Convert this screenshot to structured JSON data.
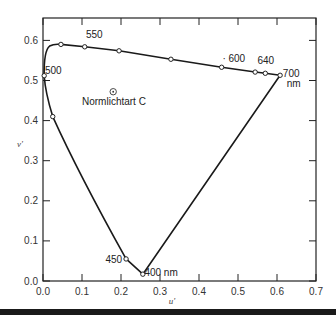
{
  "chart_data": {
    "type": "line",
    "title": "",
    "xlabel": "u'",
    "ylabel": "v'",
    "xlim": [
      0.0,
      0.7
    ],
    "ylim": [
      0.0,
      0.6
    ],
    "x_ticks": [
      "0.0",
      "0.1",
      "0.2",
      "0.3",
      "0.4",
      "0.5",
      "0.6",
      "0.7"
    ],
    "y_ticks": [
      "0.0",
      "0.1",
      "0.2",
      "0.3",
      "0.4",
      "0.5",
      "0.6"
    ],
    "grid": false,
    "series": [
      {
        "name": "spectral locus (CIE 1976 UCS)",
        "closed": true,
        "points": [
          {
            "u": 0.256,
            "v": 0.017,
            "label": "400 nm"
          },
          {
            "u": 0.213,
            "v": 0.055,
            "label": "450"
          },
          {
            "u": 0.025,
            "v": 0.41,
            "label": ""
          },
          {
            "u": 0.003,
            "v": 0.512,
            "label": "500"
          },
          {
            "u": 0.017,
            "v": 0.586,
            "label": ""
          },
          {
            "u": 0.046,
            "v": 0.59,
            "label": ""
          },
          {
            "u": 0.107,
            "v": 0.584,
            "label": "550"
          },
          {
            "u": 0.195,
            "v": 0.574,
            "label": ""
          },
          {
            "u": 0.328,
            "v": 0.553,
            "label": ""
          },
          {
            "u": 0.458,
            "v": 0.533,
            "label": "600"
          },
          {
            "u": 0.544,
            "v": 0.521,
            "label": ""
          },
          {
            "u": 0.57,
            "v": 0.518,
            "label": "640"
          },
          {
            "u": 0.608,
            "v": 0.513,
            "label": "700 nm"
          }
        ]
      }
    ],
    "markers": [
      {
        "name": "Normlichtart C",
        "u": 0.18,
        "v": 0.472,
        "symbol": "circle-dot"
      }
    ],
    "annotations": [
      {
        "text": "500",
        "u": 0.005,
        "v": 0.515
      },
      {
        "text": "550",
        "u": 0.11,
        "v": 0.605
      },
      {
        "text": "· 600",
        "u": 0.46,
        "v": 0.545
      },
      {
        "text": "640",
        "u": 0.55,
        "v": 0.54
      },
      {
        "text": "700",
        "u": 0.615,
        "v": 0.508
      },
      {
        "text": "nm",
        "u": 0.625,
        "v": 0.485
      },
      {
        "text": "450",
        "u": 0.16,
        "v": 0.045
      },
      {
        "text": "400 nm",
        "u": 0.26,
        "v": 0.013
      },
      {
        "text": "Normlichtart C",
        "u": 0.1,
        "v": 0.44
      }
    ]
  }
}
